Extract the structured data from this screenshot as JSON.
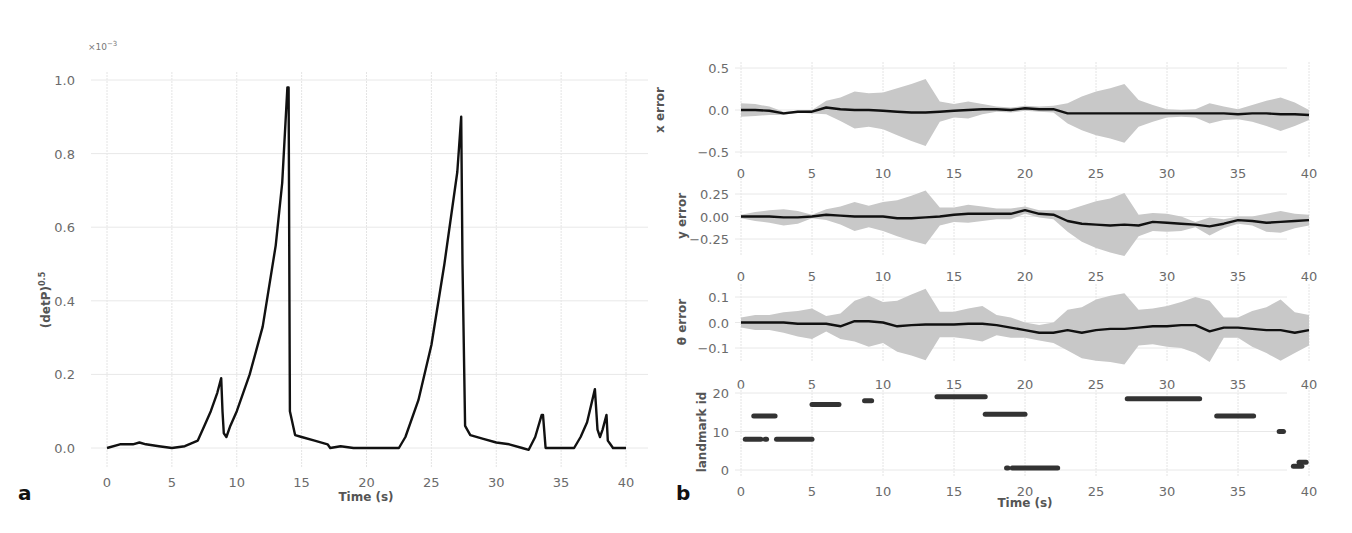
{
  "chart_data": [
    {
      "panel": "a",
      "type": "line",
      "title": "",
      "xlabel": "Time (s)",
      "ylabel": "(detP)^0.5",
      "ylabel_display": "(detP)0.5",
      "y_scale_note": "×10⁻³",
      "xlim": [
        0,
        40
      ],
      "ylim": [
        0,
        1.0
      ],
      "xticks": [
        "0",
        "5",
        "10",
        "15",
        "20",
        "25",
        "30",
        "35",
        "40"
      ],
      "yticks": [
        "0.0",
        "0.2",
        "0.4",
        "0.6",
        "0.8",
        "1.0"
      ],
      "grid": true,
      "x": [
        0,
        1,
        2,
        2.5,
        3,
        4,
        5,
        6,
        7,
        7.5,
        8,
        8.5,
        8.8,
        8.9,
        9.0,
        9.2,
        9.5,
        10,
        11,
        12,
        13,
        13.5,
        13.9,
        14.0,
        14.1,
        14.5,
        15,
        16,
        17,
        17.2,
        18,
        19,
        20,
        21,
        22,
        22.5,
        23,
        24,
        25,
        26,
        27,
        27.3,
        27.4,
        27.6,
        28,
        29,
        30,
        31,
        32,
        32.5,
        33,
        33.5,
        33.6,
        33.8,
        34,
        35,
        36,
        36.5,
        37,
        37.6,
        37.8,
        38.0,
        38.2,
        38.5,
        38.6,
        38.8,
        39,
        40
      ],
      "values": [
        0.0,
        0.01,
        0.01,
        0.015,
        0.01,
        0.005,
        0.0,
        0.005,
        0.02,
        0.06,
        0.1,
        0.15,
        0.19,
        0.1,
        0.04,
        0.03,
        0.06,
        0.1,
        0.2,
        0.33,
        0.55,
        0.72,
        0.98,
        0.98,
        0.1,
        0.035,
        0.03,
        0.02,
        0.01,
        0.0,
        0.005,
        0.0,
        0.0,
        0.0,
        0.0,
        0.0,
        0.03,
        0.13,
        0.28,
        0.5,
        0.75,
        0.9,
        0.5,
        0.06,
        0.035,
        0.025,
        0.015,
        0.01,
        0.0,
        -0.005,
        0.03,
        0.09,
        0.09,
        0.0,
        0.0,
        0.0,
        0.0,
        0.03,
        0.07,
        0.16,
        0.05,
        0.03,
        0.05,
        0.09,
        0.02,
        0.01,
        0.0,
        0.0
      ]
    },
    {
      "panel": "b",
      "type": "line",
      "subplots": [
        {
          "name": "x error",
          "ylabel": "x error",
          "ylim": [
            -0.5,
            0.5
          ],
          "yticks": [
            "0.5",
            "0.0",
            "−0.5"
          ],
          "xticks": [
            "0",
            "5",
            "10",
            "15",
            "20",
            "25",
            "30",
            "35",
            "40"
          ],
          "x": [
            0,
            1,
            2,
            3,
            4,
            5,
            6,
            7,
            8,
            9,
            10,
            11,
            12,
            13,
            14,
            15,
            16,
            17,
            18,
            19,
            20,
            21,
            22,
            23,
            24,
            25,
            26,
            27,
            28,
            29,
            30,
            31,
            32,
            33,
            34,
            35,
            36,
            37,
            38,
            39,
            40
          ],
          "values": [
            0,
            0,
            -0.01,
            -0.04,
            -0.02,
            -0.02,
            0.03,
            0.01,
            0,
            0,
            -0.01,
            -0.02,
            -0.03,
            -0.03,
            -0.02,
            -0.01,
            0,
            0.01,
            0.01,
            0,
            0.02,
            0.01,
            0.01,
            -0.04,
            -0.04,
            -0.04,
            -0.04,
            -0.04,
            -0.04,
            -0.04,
            -0.04,
            -0.04,
            -0.04,
            -0.04,
            -0.04,
            -0.05,
            -0.04,
            -0.04,
            -0.05,
            -0.05,
            -0.06
          ],
          "band": [
            0.08,
            0.07,
            0.05,
            0.02,
            0.01,
            0.02,
            0.08,
            0.14,
            0.22,
            0.2,
            0.22,
            0.28,
            0.34,
            0.4,
            0.12,
            0.08,
            0.1,
            0.06,
            0.03,
            0.03,
            0.03,
            0.03,
            0.04,
            0.12,
            0.2,
            0.26,
            0.3,
            0.35,
            0.16,
            0.1,
            0.05,
            0.04,
            0.05,
            0.12,
            0.08,
            0.06,
            0.1,
            0.15,
            0.2,
            0.14,
            0.06
          ]
        },
        {
          "name": "y error",
          "ylabel": "y error",
          "ylim": [
            -0.35,
            0.35
          ],
          "yticks": [
            "0.25",
            "0.00",
            "−0.25"
          ],
          "xticks": [
            "0",
            "5",
            "10",
            "15",
            "20",
            "25",
            "30",
            "35",
            "40"
          ],
          "x": [
            0,
            1,
            2,
            3,
            4,
            5,
            6,
            7,
            8,
            9,
            10,
            11,
            12,
            13,
            14,
            15,
            16,
            17,
            18,
            19,
            20,
            21,
            22,
            23,
            24,
            25,
            26,
            27,
            28,
            29,
            30,
            31,
            32,
            33,
            34,
            35,
            36,
            37,
            38,
            39,
            40
          ],
          "values": [
            0,
            0,
            0,
            -0.01,
            -0.01,
            0,
            0.02,
            0.01,
            0,
            0,
            0,
            -0.02,
            -0.02,
            -0.01,
            0,
            0.02,
            0.03,
            0.03,
            0.03,
            0.03,
            0.07,
            0.03,
            0.02,
            -0.05,
            -0.08,
            -0.09,
            -0.1,
            -0.09,
            -0.1,
            -0.06,
            -0.07,
            -0.08,
            -0.09,
            -0.11,
            -0.08,
            -0.04,
            -0.05,
            -0.07,
            -0.06,
            -0.05,
            -0.04
          ],
          "band": [
            0.02,
            0.05,
            0.07,
            0.09,
            0.07,
            0.02,
            0.06,
            0.1,
            0.16,
            0.12,
            0.16,
            0.2,
            0.25,
            0.3,
            0.1,
            0.08,
            0.1,
            0.08,
            0.06,
            0.06,
            0.04,
            0.04,
            0.05,
            0.12,
            0.2,
            0.26,
            0.3,
            0.35,
            0.12,
            0.1,
            0.1,
            0.08,
            0.03,
            0.1,
            0.05,
            0.04,
            0.05,
            0.1,
            0.12,
            0.08,
            0.06
          ]
        },
        {
          "name": "theta error",
          "ylabel": "θ error",
          "ylim": [
            -0.15,
            0.15
          ],
          "yticks": [
            "0.1",
            "0.0",
            "−0.1"
          ],
          "xticks": [
            "0",
            "5",
            "10",
            "15",
            "20",
            "25",
            "30",
            "35",
            "40"
          ],
          "x": [
            0,
            1,
            2,
            3,
            4,
            5,
            6,
            7,
            8,
            9,
            10,
            11,
            12,
            13,
            14,
            15,
            16,
            17,
            18,
            19,
            20,
            21,
            22,
            23,
            24,
            25,
            26,
            27,
            28,
            29,
            30,
            31,
            32,
            33,
            34,
            35,
            36,
            37,
            38,
            39,
            40
          ],
          "values": [
            0,
            0,
            0,
            0,
            -0.005,
            -0.005,
            -0.005,
            -0.015,
            0.005,
            0.005,
            0,
            -0.015,
            -0.01,
            -0.008,
            -0.008,
            -0.008,
            -0.005,
            -0.005,
            -0.01,
            -0.02,
            -0.03,
            -0.04,
            -0.04,
            -0.03,
            -0.04,
            -0.03,
            -0.025,
            -0.025,
            -0.02,
            -0.015,
            -0.015,
            -0.01,
            -0.01,
            -0.035,
            -0.02,
            -0.02,
            -0.025,
            -0.03,
            -0.03,
            -0.04,
            -0.03
          ],
          "band": [
            0.02,
            0.03,
            0.03,
            0.04,
            0.05,
            0.06,
            0.03,
            0.05,
            0.08,
            0.1,
            0.08,
            0.1,
            0.12,
            0.14,
            0.05,
            0.05,
            0.06,
            0.07,
            0.04,
            0.04,
            0.03,
            0.03,
            0.04,
            0.08,
            0.1,
            0.12,
            0.13,
            0.14,
            0.07,
            0.07,
            0.08,
            0.09,
            0.11,
            0.12,
            0.04,
            0.04,
            0.07,
            0.09,
            0.12,
            0.08,
            0.06
          ]
        },
        {
          "name": "landmark id",
          "type": "scatter",
          "ylabel": "landmark id",
          "xlabel": "Time (s)",
          "ylim": [
            0,
            20
          ],
          "yticks": [
            "20",
            "10",
            "0"
          ],
          "xticks": [
            "0",
            "5",
            "10",
            "15",
            "20",
            "25",
            "30",
            "35",
            "40"
          ],
          "segments": [
            {
              "x0": 0.3,
              "x1": 1.4,
              "id": 8
            },
            {
              "x0": 1.7,
              "x1": 1.8,
              "id": 8
            },
            {
              "x0": 2.5,
              "x1": 5.0,
              "id": 8
            },
            {
              "x0": 0.9,
              "x1": 2.4,
              "id": 14
            },
            {
              "x0": 5.0,
              "x1": 6.9,
              "id": 17
            },
            {
              "x0": 8.7,
              "x1": 9.2,
              "id": 18
            },
            {
              "x0": 13.8,
              "x1": 17.2,
              "id": 19
            },
            {
              "x0": 17.2,
              "x1": 20.0,
              "id": 14.5
            },
            {
              "x0": 18.7,
              "x1": 18.8,
              "id": 0.5
            },
            {
              "x0": 19.1,
              "x1": 22.3,
              "id": 0.5
            },
            {
              "x0": 27.2,
              "x1": 32.3,
              "id": 18.5
            },
            {
              "x0": 33.5,
              "x1": 36.1,
              "id": 14
            },
            {
              "x0": 37.9,
              "x1": 38.2,
              "id": 10
            },
            {
              "x0": 38.9,
              "x1": 39.5,
              "id": 1
            },
            {
              "x0": 39.3,
              "x1": 39.8,
              "id": 2
            }
          ]
        }
      ]
    }
  ],
  "labels": {
    "panel_a": "a",
    "panel_b": "b",
    "sci_note": "×10",
    "sci_exp": "−3",
    "a_ylabel_base": "(detP)",
    "a_ylabel_exp": "0.5",
    "a_xlabel": "Time (s)",
    "b_xlabel": "Time (s)",
    "b_ylabel_x": "x error",
    "b_ylabel_y": "y error",
    "b_ylabel_theta": "θ error",
    "b_ylabel_landmark": "landmark id"
  },
  "colors": {
    "line": "#111111",
    "band": "#c8c8c8",
    "grid": "#e4e4e4",
    "tick_text": "#6b6b6b",
    "scatter": "#333333"
  }
}
